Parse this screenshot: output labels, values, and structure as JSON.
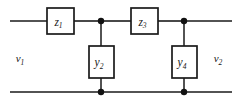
{
  "diagram": {
    "type": "circuit-schematic",
    "line_color": "#1a1a1a",
    "box_fill": "#ffffff",
    "background": "#ffffff",
    "series_elements": [
      {
        "id": "z1",
        "symbol": "z",
        "subscript": "1",
        "label": "z1",
        "orientation": "horizontal",
        "x": 60.5,
        "y": 21
      },
      {
        "id": "z3",
        "symbol": "z",
        "subscript": "3",
        "label": "z3",
        "orientation": "horizontal",
        "x": 144.5,
        "y": 21
      }
    ],
    "shunt_elements": [
      {
        "id": "y2",
        "symbol": "y",
        "subscript": "2",
        "label": "y2",
        "orientation": "vertical",
        "x": 101,
        "y": 62
      },
      {
        "id": "y4",
        "symbol": "y",
        "subscript": "4",
        "label": "y4",
        "orientation": "vertical",
        "x": 184,
        "y": 62
      }
    ],
    "port_labels": [
      {
        "id": "v1",
        "symbol": "v",
        "subscript": "1",
        "label": "v1",
        "x": 20,
        "y": 62
      },
      {
        "id": "v2",
        "symbol": "v",
        "subscript": "2",
        "label": "v2",
        "x": 218,
        "y": 62
      }
    ],
    "nodes": [
      {
        "id": "node-top-left",
        "x": 101,
        "y": 21
      },
      {
        "id": "node-top-right",
        "x": 184,
        "y": 21
      },
      {
        "id": "node-bottom-left",
        "x": 101,
        "y": 92
      },
      {
        "id": "node-bottom-right",
        "x": 184,
        "y": 92
      }
    ],
    "rails": [
      {
        "id": "top-rail",
        "y": 21,
        "x1": 10,
        "x2": 232
      },
      {
        "id": "bottom-rail",
        "y": 92,
        "x1": 10,
        "x2": 232
      }
    ]
  }
}
